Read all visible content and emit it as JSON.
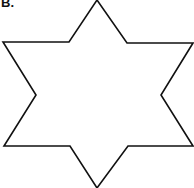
{
  "figure": {
    "label": "B.",
    "shape": "six-pointed-star",
    "stroke_color": "#111111",
    "fill_color": "#ffffff"
  }
}
